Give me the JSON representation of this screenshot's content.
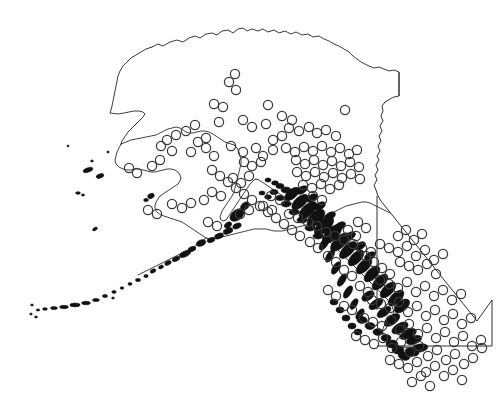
{
  "figure": {
    "title": "",
    "subtitle": "",
    "caption": "",
    "background_color": "#ffffff",
    "outline_color": "#1a1a1a",
    "marker_color": "#3a3a3a",
    "marker_shape": "open-circle",
    "marker_radius_px": 4.6,
    "width_px": 498,
    "height_px": 393
  },
  "chart_data": {
    "type": "scatter",
    "title": "",
    "subtitle": "",
    "xlabel": "",
    "ylabel": "",
    "xlim": [
      0,
      498
    ],
    "ylim": [
      393,
      0
    ],
    "grid": false,
    "legend": null,
    "legend_position": "none",
    "axes_visible": false,
    "tick_labels_x": [],
    "tick_labels_y": [],
    "projection_note": "map of Alaska and British Columbia with point occurrences",
    "basemap_regions": [
      "Alaska",
      "Aleutian Islands",
      "Alaska Panhandle",
      "British Columbia"
    ],
    "series": [
      {
        "name": "occurrence records",
        "marker": "open-circle",
        "color": "#3a3a3a",
        "count": 212,
        "points": [
          [
            235,
            74
          ],
          [
            229,
            82
          ],
          [
            236,
            90
          ],
          [
            214,
            104
          ],
          [
            223,
            107
          ],
          [
            268,
            105
          ],
          [
            345,
            110
          ],
          [
            195,
            125
          ],
          [
            186,
            131
          ],
          [
            219,
            122
          ],
          [
            243,
            120
          ],
          [
            252,
            127
          ],
          [
            266,
            124
          ],
          [
            289,
            128
          ],
          [
            299,
            131
          ],
          [
            309,
            127
          ],
          [
            317,
            133
          ],
          [
            326,
            130
          ],
          [
            336,
            136
          ],
          [
            161,
            146
          ],
          [
            172,
            151
          ],
          [
            191,
            152
          ],
          [
            206,
            148
          ],
          [
            214,
            156
          ],
          [
            231,
            146
          ],
          [
            243,
            152
          ],
          [
            256,
            148
          ],
          [
            263,
            156
          ],
          [
            273,
            150
          ],
          [
            286,
            148
          ],
          [
            295,
            152
          ],
          [
            304,
            147
          ],
          [
            313,
            151
          ],
          [
            322,
            146
          ],
          [
            331,
            152
          ],
          [
            340,
            148
          ],
          [
            349,
            154
          ],
          [
            357,
            150
          ],
          [
            244,
            162
          ],
          [
            252,
            166
          ],
          [
            261,
            162
          ],
          [
            296,
            160
          ],
          [
            305,
            164
          ],
          [
            314,
            160
          ],
          [
            323,
            165
          ],
          [
            332,
            161
          ],
          [
            341,
            166
          ],
          [
            350,
            162
          ],
          [
            359,
            167
          ],
          [
            297,
            172
          ],
          [
            306,
            176
          ],
          [
            315,
            172
          ],
          [
            324,
            177
          ],
          [
            333,
            173
          ],
          [
            342,
            178
          ],
          [
            351,
            174
          ],
          [
            360,
            179
          ],
          [
            303,
            185
          ],
          [
            312,
            188
          ],
          [
            321,
            184
          ],
          [
            330,
            189
          ],
          [
            339,
            185
          ],
          [
            233,
            178
          ],
          [
            241,
            183
          ],
          [
            249,
            176
          ],
          [
            212,
            192
          ],
          [
            221,
            196
          ],
          [
            204,
            200
          ],
          [
            172,
            204
          ],
          [
            182,
            208
          ],
          [
            191,
            203
          ],
          [
            148,
            210
          ],
          [
            157,
            214
          ],
          [
            313,
            196
          ],
          [
            322,
            200
          ],
          [
            271,
            196
          ],
          [
            280,
            200
          ],
          [
            263,
            206
          ],
          [
            272,
            210
          ],
          [
            240,
            214
          ],
          [
            249,
            210
          ],
          [
            208,
            222
          ],
          [
            217,
            226
          ],
          [
            289,
            214
          ],
          [
            298,
            218
          ],
          [
            308,
            222
          ],
          [
            317,
            226
          ],
          [
            326,
            232
          ],
          [
            335,
            236
          ],
          [
            344,
            240
          ],
          [
            353,
            244
          ],
          [
            362,
            248
          ],
          [
            371,
            252
          ],
          [
            380,
            244
          ],
          [
            389,
            248
          ],
          [
            398,
            252
          ],
          [
            407,
            246
          ],
          [
            416,
            256
          ],
          [
            425,
            250
          ],
          [
            434,
            260
          ],
          [
            443,
            254
          ],
          [
            400,
            262
          ],
          [
            409,
            266
          ],
          [
            418,
            270
          ],
          [
            427,
            264
          ],
          [
            436,
            274
          ],
          [
            380,
            280
          ],
          [
            389,
            284
          ],
          [
            398,
            288
          ],
          [
            407,
            282
          ],
          [
            416,
            292
          ],
          [
            425,
            286
          ],
          [
            434,
            296
          ],
          [
            443,
            290
          ],
          [
            452,
            300
          ],
          [
            461,
            294
          ],
          [
            372,
            300
          ],
          [
            381,
            304
          ],
          [
            390,
            308
          ],
          [
            399,
            302
          ],
          [
            408,
            312
          ],
          [
            417,
            306
          ],
          [
            426,
            316
          ],
          [
            435,
            310
          ],
          [
            444,
            320
          ],
          [
            453,
            314
          ],
          [
            462,
            324
          ],
          [
            471,
            318
          ],
          [
            364,
            318
          ],
          [
            373,
            322
          ],
          [
            382,
            326
          ],
          [
            391,
            320
          ],
          [
            400,
            330
          ],
          [
            409,
            324
          ],
          [
            418,
            334
          ],
          [
            427,
            328
          ],
          [
            436,
            338
          ],
          [
            445,
            332
          ],
          [
            454,
            342
          ],
          [
            463,
            336
          ],
          [
            472,
            346
          ],
          [
            481,
            340
          ],
          [
            356,
            336
          ],
          [
            365,
            340
          ],
          [
            374,
            344
          ],
          [
            383,
            338
          ],
          [
            392,
            348
          ],
          [
            401,
            342
          ],
          [
            410,
            352
          ],
          [
            419,
            346
          ],
          [
            428,
            356
          ],
          [
            437,
            350
          ],
          [
            446,
            360
          ],
          [
            455,
            354
          ],
          [
            464,
            364
          ],
          [
            473,
            358
          ],
          [
            482,
            348
          ],
          [
            390,
            360
          ],
          [
            399,
            364
          ],
          [
            408,
            368
          ],
          [
            417,
            362
          ],
          [
            426,
            372
          ],
          [
            435,
            366
          ],
          [
            444,
            376
          ],
          [
            453,
            370
          ],
          [
            462,
            380
          ],
          [
            412,
            382
          ],
          [
            421,
            376
          ],
          [
            430,
            386
          ],
          [
            344,
            306
          ],
          [
            352,
            310
          ],
          [
            336,
            296
          ],
          [
            328,
            290
          ],
          [
            360,
            286
          ],
          [
            368,
            292
          ],
          [
            352,
            276
          ],
          [
            344,
            270
          ],
          [
            336,
            262
          ],
          [
            328,
            256
          ],
          [
            318,
            248
          ],
          [
            310,
            242
          ],
          [
            300,
            236
          ],
          [
            292,
            230
          ],
          [
            284,
            224
          ],
          [
            276,
            218
          ],
          [
            268,
            212
          ],
          [
            260,
            206
          ],
          [
            252,
            200
          ],
          [
            244,
            194
          ],
          [
            236,
            188
          ],
          [
            228,
            182
          ],
          [
            220,
            176
          ],
          [
            212,
            170
          ],
          [
            366,
            256
          ],
          [
            374,
            262
          ],
          [
            382,
            268
          ],
          [
            390,
            274
          ],
          [
            398,
            236
          ],
          [
            406,
            230
          ],
          [
            414,
            240
          ],
          [
            422,
            234
          ],
          [
            348,
            230
          ],
          [
            356,
            236
          ],
          [
            358,
            222
          ],
          [
            366,
            228
          ],
          [
            292,
            120
          ],
          [
            282,
            116
          ],
          [
            273,
            140
          ],
          [
            282,
            136
          ],
          [
            176,
            135
          ],
          [
            167,
            140
          ],
          [
            206,
            138
          ],
          [
            198,
            142
          ],
          [
            160,
            160
          ],
          [
            152,
            166
          ],
          [
            137,
            173
          ],
          [
            129,
            168
          ]
        ]
      }
    ]
  },
  "basemap": {
    "alaska_mainland_label": "Alaska mainland outline",
    "panhandle_label": "Alaska panhandle archipelago",
    "aleutian_label": "Aleutian island chain",
    "bc_border_label": "British Columbia political border"
  }
}
